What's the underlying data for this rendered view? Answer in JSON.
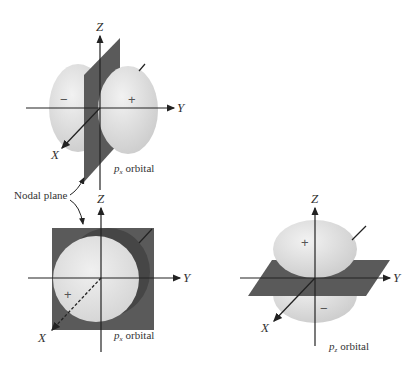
{
  "diagram": {
    "panels": [
      {
        "id": "px",
        "label_p": "p",
        "label_sub": "x",
        "label_suffix": "orbital",
        "signs": {
          "left": "−",
          "right": "+"
        },
        "axes": {
          "z": "Z",
          "y": "Y",
          "x": "X"
        }
      },
      {
        "id": "px-front",
        "label_p": "p",
        "label_sub": "x",
        "label_suffix": "orbital",
        "signs": {
          "front": "+"
        },
        "axes": {
          "z": "Z",
          "y": "Y",
          "x": "X"
        }
      },
      {
        "id": "pz",
        "label_p": "p",
        "label_sub": "z",
        "label_suffix": "orbital",
        "signs": {
          "top": "+",
          "bottom": "−"
        },
        "axes": {
          "z": "Z",
          "y": "Y",
          "x": "X"
        }
      }
    ],
    "nodal_plane_label": "Nodal plane",
    "caption": "Figure 4-16  Boundary surface representations of 2p orbitals"
  },
  "colors": {
    "lobe": "#e6e6e6",
    "lobe_shade": "#cfcfcf",
    "plane": "#5a5a5a",
    "plane_dark": "#444444",
    "axis": "#222222"
  }
}
